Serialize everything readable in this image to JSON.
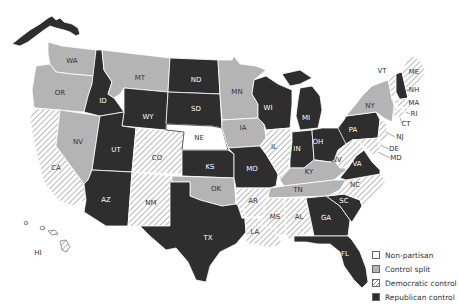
{
  "colors": {
    "non_partisan": "#ffffff",
    "control_split": "#b4b4b4",
    "democratic": "hatch",
    "republican": "#2e2e2e",
    "border": "#ffffff",
    "hatch_line": "#8a8a8a",
    "label_on_dark": "#ffffff",
    "label_on_light": "#333333"
  },
  "legend": [
    {
      "key": "non_partisan",
      "label": "Non-partisan"
    },
    {
      "key": "control_split",
      "label": "Control split"
    },
    {
      "key": "democratic",
      "label": "Democratic control"
    },
    {
      "key": "republican",
      "label": "Republican control"
    }
  ],
  "states": {
    "AK": "republican",
    "WA": "control_split",
    "OR": "control_split",
    "CA": "democratic",
    "NV": "control_split",
    "ID": "republican",
    "MT": "control_split",
    "WY": "republican",
    "UT": "republican",
    "AZ": "republican",
    "CO": "democratic",
    "NM": "democratic",
    "ND": "republican",
    "SD": "republican",
    "NE": "non_partisan",
    "KS": "republican",
    "OK": "control_split",
    "TX": "republican",
    "MN": "control_split",
    "IA": "control_split",
    "MO": "republican",
    "AR": "democratic",
    "LA": "democratic",
    "WI": "republican",
    "IL": "democratic",
    "MI": "republican",
    "IN": "republican",
    "OH": "republican",
    "KY": "control_split",
    "TN": "control_split",
    "MS": "democratic",
    "AL": "democratic",
    "GA": "republican",
    "FL": "republican",
    "SC": "republican",
    "NC": "democratic",
    "VA": "republican",
    "WV": "democratic",
    "PA": "republican",
    "NY": "control_split",
    "VT": "democratic",
    "NH": "republican",
    "ME": "democratic",
    "MA": "democratic",
    "RI": "democratic",
    "CT": "democratic",
    "NJ": "democratic",
    "DE": "democratic",
    "MD": "democratic",
    "HI": "democratic"
  },
  "labels": {
    "WA": "WA",
    "OR": "OR",
    "CA": "CA",
    "NV": "NV",
    "ID": "ID",
    "MT": "MT",
    "WY": "WY",
    "UT": "UT",
    "AZ": "AZ",
    "CO": "CO",
    "NM": "NM",
    "ND": "ND",
    "SD": "SD",
    "NE": "NE",
    "KS": "KS",
    "OK": "OK",
    "TX": "TX",
    "MN": "MN",
    "IA": "IA",
    "MO": "MO",
    "AR": "AR",
    "LA": "LA",
    "WI": "WI",
    "IL": "IL",
    "MI": "MI",
    "IN": "IN",
    "OH": "OH",
    "KY": "KY",
    "TN": "TN",
    "MS": "MS",
    "AL": "AL",
    "GA": "GA",
    "FL": "FL",
    "SC": "SC",
    "NC": "NC",
    "VA": "VA",
    "WV": "WV",
    "PA": "PA",
    "NY": "NY",
    "VT": "VT",
    "NH": "NH",
    "ME": "ME",
    "MA": "MA",
    "RI": "RI",
    "CT": "CT",
    "NJ": "NJ",
    "DE": "DE",
    "MD": "MD",
    "HI": "HI"
  }
}
